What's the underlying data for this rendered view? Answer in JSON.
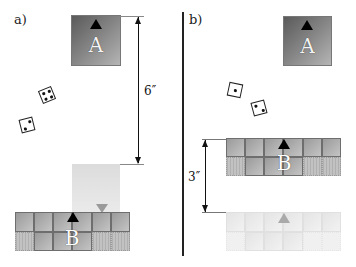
{
  "panels": [
    {
      "label": "a)",
      "block_a": {
        "letter": "A"
      },
      "block_b": {
        "letter": "B"
      },
      "dimension": {
        "label": "6″",
        "description": "distance between top of block A and bottom of ghost block"
      },
      "dice": [
        {
          "pips": 4
        },
        {
          "pips": 2
        }
      ]
    },
    {
      "label": "b)",
      "block_a": {
        "letter": "A"
      },
      "block_b": {
        "letter": "B"
      },
      "dimension": {
        "label": "3″",
        "description": "distance between top of block B and ghost block B"
      },
      "dice": [
        {
          "pips": 1
        },
        {
          "pips": 2
        }
      ]
    }
  ],
  "colors": {
    "block_dark": "#5a5a5a",
    "block_light": "#b5b5b5",
    "ghost": "#e4e4e4",
    "line": "#111111"
  }
}
